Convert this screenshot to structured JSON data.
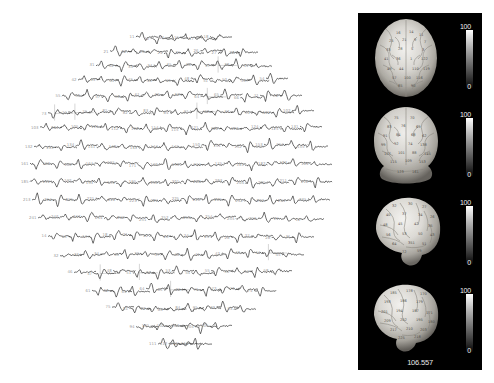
{
  "figure": {
    "background_color": "#ffffff",
    "width": 494,
    "height": 383
  },
  "erp_panel": {
    "name": "erp-topographic-array",
    "description": "Dense multichannel ERP waveform array arranged in head-shaped oval layout",
    "trace_color": "#3a3a3a",
    "axis_color": "#b9b9b9",
    "label_color": "#9a9a9a",
    "channel_count": 247,
    "channel_labels": [
      "11",
      "12",
      "14",
      "15",
      "17",
      "18",
      "21",
      "22",
      "23",
      "24",
      "25",
      "26",
      "27",
      "28",
      "31",
      "32",
      "33",
      "34",
      "35",
      "36",
      "37",
      "38",
      "41",
      "42",
      "43",
      "44",
      "45",
      "46",
      "47",
      "48",
      "51",
      "52",
      "53",
      "54",
      "55",
      "56",
      "57",
      "58",
      "61",
      "62",
      "63",
      "64",
      "65",
      "66",
      "71",
      "72",
      "73",
      "74",
      "75",
      "81",
      "82",
      "83",
      "84",
      "91",
      "92",
      "93",
      "94",
      "101",
      "102",
      "103",
      "104",
      "105",
      "111",
      "112",
      "113",
      "114",
      "115",
      "121",
      "122",
      "123",
      "124",
      "125",
      "131",
      "132",
      "133",
      "134",
      "141",
      "142",
      "143",
      "144",
      "145",
      "150",
      "151",
      "152",
      "153",
      "154",
      "155",
      "161",
      "162",
      "163",
      "164",
      "165",
      "171",
      "172",
      "173",
      "174",
      "175",
      "181",
      "182",
      "183",
      "184",
      "185",
      "191",
      "192",
      "193",
      "194",
      "195",
      "196",
      "201",
      "202",
      "203",
      "204",
      "205",
      "211",
      "212",
      "213",
      "214",
      "215",
      "221",
      "222",
      "223",
      "224",
      "225",
      "226",
      "231",
      "232",
      "233",
      "234",
      "235",
      "241",
      "242",
      "243",
      "244",
      "245",
      "251",
      "252",
      "253",
      "254",
      "255",
      "256"
    ]
  },
  "brain_panel": {
    "name": "brain-renderings-panel",
    "background_color": "#000000",
    "caption": "106.557",
    "views": [
      {
        "name": "superior-view",
        "label": "superior",
        "colorbar": {
          "max": "100",
          "min": "0"
        }
      },
      {
        "name": "posterior-view",
        "label": "posterior",
        "colorbar": {
          "max": "100",
          "min": "0"
        }
      },
      {
        "name": "left-lateral-view",
        "label": "left lateral",
        "colorbar": {
          "max": "100",
          "min": "0"
        }
      },
      {
        "name": "right-lateral-view",
        "label": "right lateral",
        "colorbar": {
          "max": "100",
          "min": "0"
        }
      }
    ],
    "colorbar_scale": {
      "max_label": "100",
      "min_label": "0",
      "colormap": "grayscale",
      "high_color": "#ffffff",
      "low_color": "#000000"
    }
  },
  "chart_data": {
    "type": "line",
    "xlabel": "Time (ms)",
    "ylabel": "Amplitude (uV)",
    "legend": [],
    "grid": false,
    "series_count": 247,
    "note": "Each mini-axis shows one channel's averaged event-related potential waveform; channels are positioned by scalp location in an oval head layout.",
    "colorbar": {
      "min": 0,
      "max": 100,
      "units": ""
    },
    "scalar_readout": 106.557
  }
}
